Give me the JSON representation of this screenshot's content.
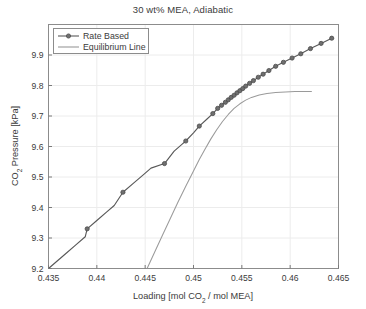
{
  "chart_data": {
    "type": "line",
    "title": "30 wt% MEA, Adiabatic",
    "xlabel": "Loading [mol CO2 / mol MEA]",
    "xlabel_parts": {
      "pre": "Loading [mol CO",
      "sub": "2",
      "post": " / mol MEA]"
    },
    "ylabel": "CO2 Pressure [kPa]",
    "ylabel_parts": {
      "pre": "CO",
      "sub": "2",
      "post": " Pressure [kPa]"
    },
    "xlim": [
      0.435,
      0.465
    ],
    "ylim": [
      9.2,
      10.0
    ],
    "xticks": [
      0.435,
      0.44,
      0.445,
      0.45,
      0.455,
      0.46,
      0.465
    ],
    "xtick_labels": [
      "0.435",
      "0.44",
      "0.445",
      "0.45",
      "0.455",
      "0.46",
      "0.465"
    ],
    "yticks": [
      9.2,
      9.3,
      9.4,
      9.5,
      9.6,
      9.7,
      9.8,
      9.9
    ],
    "ytick_labels": [
      "9.2",
      "9.3",
      "9.4",
      "9.5",
      "9.6",
      "9.7",
      "9.8",
      "9.9"
    ],
    "grid": true,
    "legend_position": "upper-left",
    "colors": {
      "rate_based": "#595959",
      "equilibrium": "#9a9a9a",
      "grid": "#ececec",
      "axis": "#7a7a7a",
      "text": "#3b3b3b"
    },
    "series": [
      {
        "name": "Rate Based",
        "style": "line-with-markers",
        "marker": "circle",
        "color": "#595959",
        "points": [
          [
            0.435,
            9.2
          ],
          [
            0.4359,
            9.2245
          ],
          [
            0.4368,
            9.249
          ],
          [
            0.4378,
            9.2765
          ],
          [
            0.4388,
            9.304
          ],
          [
            0.439,
            9.33
          ],
          [
            0.44,
            9.3575
          ],
          [
            0.441,
            9.385
          ],
          [
            0.4418,
            9.4065
          ],
          [
            0.4427,
            9.45
          ],
          [
            0.4438,
            9.48
          ],
          [
            0.4448,
            9.507
          ],
          [
            0.4456,
            9.529
          ],
          [
            0.447,
            9.544
          ],
          [
            0.448,
            9.585
          ],
          [
            0.4488,
            9.607
          ],
          [
            0.4492,
            9.618
          ],
          [
            0.45,
            9.645
          ],
          [
            0.4506,
            9.667
          ],
          [
            0.4514,
            9.69
          ],
          [
            0.452,
            9.708
          ],
          [
            0.4525,
            9.725
          ],
          [
            0.4529,
            9.735
          ],
          [
            0.4533,
            9.745
          ],
          [
            0.4536,
            9.753
          ],
          [
            0.4539,
            9.761
          ],
          [
            0.4542,
            9.768
          ],
          [
            0.4545,
            9.776
          ],
          [
            0.4548,
            9.783
          ],
          [
            0.4551,
            9.79
          ],
          [
            0.4554,
            9.798
          ],
          [
            0.4558,
            9.807
          ],
          [
            0.4562,
            9.816
          ],
          [
            0.4567,
            9.827
          ],
          [
            0.4572,
            9.837
          ],
          [
            0.4578,
            9.849
          ],
          [
            0.4585,
            9.863
          ],
          [
            0.4593,
            9.876
          ],
          [
            0.4602,
            9.89
          ],
          [
            0.4611,
            9.904
          ],
          [
            0.4621,
            9.921
          ],
          [
            0.4632,
            9.938
          ],
          [
            0.4643,
            9.955
          ]
        ],
        "marker_points": [
          [
            0.439,
            9.33
          ],
          [
            0.4427,
            9.45
          ],
          [
            0.447,
            9.544
          ],
          [
            0.4492,
            9.618
          ],
          [
            0.4506,
            9.667
          ],
          [
            0.452,
            9.708
          ],
          [
            0.4525,
            9.725
          ],
          [
            0.4529,
            9.735
          ],
          [
            0.4533,
            9.745
          ],
          [
            0.4536,
            9.753
          ],
          [
            0.4539,
            9.761
          ],
          [
            0.4542,
            9.768
          ],
          [
            0.4545,
            9.776
          ],
          [
            0.4548,
            9.783
          ],
          [
            0.4551,
            9.79
          ],
          [
            0.4554,
            9.798
          ],
          [
            0.4558,
            9.807
          ],
          [
            0.4562,
            9.816
          ],
          [
            0.4567,
            9.827
          ],
          [
            0.4572,
            9.837
          ],
          [
            0.4578,
            9.849
          ],
          [
            0.4585,
            9.863
          ],
          [
            0.4593,
            9.876
          ],
          [
            0.4602,
            9.89
          ],
          [
            0.4611,
            9.904
          ],
          [
            0.4621,
            9.921
          ],
          [
            0.4632,
            9.938
          ],
          [
            0.4643,
            9.955
          ]
        ]
      },
      {
        "name": "Equilibrium Line",
        "style": "line",
        "marker": "none",
        "color": "#9a9a9a",
        "points": [
          [
            0.4452,
            9.2
          ],
          [
            0.446,
            9.255
          ],
          [
            0.4468,
            9.31
          ],
          [
            0.4476,
            9.364
          ],
          [
            0.4484,
            9.418
          ],
          [
            0.4492,
            9.47
          ],
          [
            0.45,
            9.52
          ],
          [
            0.4506,
            9.557
          ],
          [
            0.4512,
            9.592
          ],
          [
            0.4518,
            9.625
          ],
          [
            0.4524,
            9.655
          ],
          [
            0.453,
            9.682
          ],
          [
            0.4536,
            9.705
          ],
          [
            0.4542,
            9.725
          ],
          [
            0.4548,
            9.74
          ],
          [
            0.4554,
            9.752
          ],
          [
            0.456,
            9.761
          ],
          [
            0.4568,
            9.769
          ],
          [
            0.4576,
            9.774
          ],
          [
            0.4585,
            9.777
          ],
          [
            0.4595,
            9.779
          ],
          [
            0.4605,
            9.78
          ],
          [
            0.4615,
            9.7805
          ],
          [
            0.4622,
            9.7805
          ]
        ]
      }
    ]
  }
}
